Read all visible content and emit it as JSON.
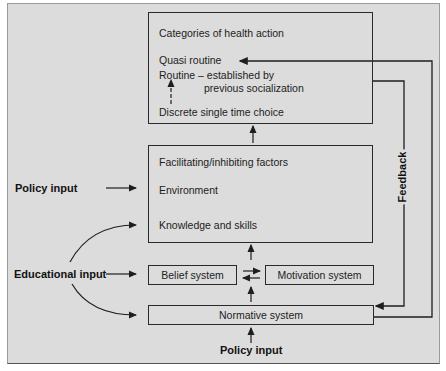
{
  "diagram": {
    "top_box": {
      "title": "Categories of health action",
      "items": [
        "Quasi routine",
        "Routine – established by",
        "previous socialization",
        "Discrete single time choice"
      ]
    },
    "middle_box": {
      "title": "Facilitating/inhibiting factors",
      "items": [
        "Environment",
        "Knowledge and skills"
      ]
    },
    "belief_box": {
      "label": "Belief system"
    },
    "motivation_box": {
      "label": "Motivation system"
    },
    "normative_box": {
      "label": "Normative system"
    },
    "inputs": {
      "policy_input_left": "Policy input",
      "educational_input": "Educational input",
      "policy_input_bottom": "Policy input"
    },
    "feedback_label": "Feedback",
    "colors": {
      "background": "#dcdcdc",
      "lines": "#2a2a2a"
    }
  }
}
